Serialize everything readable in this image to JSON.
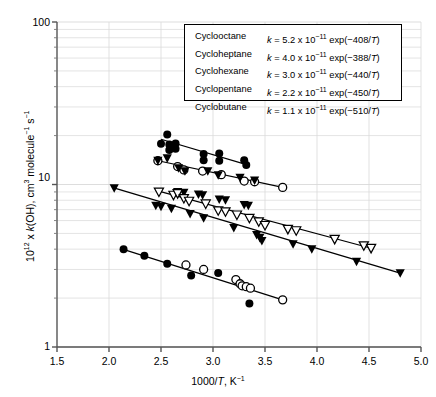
{
  "chart_data": {
    "type": "scatter",
    "title": "",
    "xlabel": "1000/T, K⁻¹",
    "ylabel": "10¹² x k(OH), cm³ molecule⁻¹ s⁻¹",
    "xscale": "linear",
    "yscale": "log",
    "xlim": [
      1.5,
      5.0
    ],
    "ylim": [
      1,
      100
    ],
    "xticks": [
      "1.5",
      "2.0",
      "2.5",
      "3.0",
      "3.5",
      "4.0",
      "4.5",
      "5.0"
    ],
    "xtick_values": [
      1.5,
      2.0,
      2.5,
      3.0,
      3.5,
      4.0,
      4.5,
      5.0
    ],
    "yticks": [
      "1",
      "10",
      "100"
    ],
    "ytick_values": [
      1,
      10,
      100
    ],
    "grid": "minor-log-horizontal-and-major-vertical",
    "legend_position": "top-right-inside-box",
    "series": [
      {
        "name": "Cyclooctane",
        "marker": "filled-circle",
        "A": "5.2 x 10⁻¹¹",
        "E_over_R": -408,
        "equation": "k = 5.2 x 10⁻¹¹ exp(−408/T)",
        "fit_line": {
          "x": [
            2.5,
            3.33
          ],
          "y": [
            19.0,
            13.2
          ]
        },
        "points": [
          {
            "x": 2.56,
            "y": 20.3
          },
          {
            "x": 2.5,
            "y": 17.8
          },
          {
            "x": 2.58,
            "y": 17.6
          },
          {
            "x": 2.64,
            "y": 17.9
          },
          {
            "x": 2.64,
            "y": 16.6
          },
          {
            "x": 2.58,
            "y": 16.3
          },
          {
            "x": 2.91,
            "y": 15.4
          },
          {
            "x": 3.06,
            "y": 15.5
          },
          {
            "x": 2.91,
            "y": 14.1
          },
          {
            "x": 3.06,
            "y": 14.0
          },
          {
            "x": 3.3,
            "y": 14.1
          },
          {
            "x": 3.32,
            "y": 13.2
          }
        ]
      },
      {
        "name": "Cycloheptane",
        "marker": "open-circle",
        "A": "4.0 x 10⁻¹¹",
        "E_over_R": -388,
        "equation": "k = 4.0 x 10⁻¹¹ exp(−388/T)",
        "fit_line": {
          "x": [
            2.45,
            3.67
          ],
          "y": [
            14.1,
            9.6
          ]
        },
        "points": [
          {
            "x": 2.47,
            "y": 14.0
          },
          {
            "x": 2.66,
            "y": 12.9
          },
          {
            "x": 2.72,
            "y": 12.3
          },
          {
            "x": 2.9,
            "y": 12.1
          },
          {
            "x": 3.08,
            "y": 11.5
          },
          {
            "x": 3.3,
            "y": 10.5
          },
          {
            "x": 3.4,
            "y": 10.4
          },
          {
            "x": 3.67,
            "y": 9.6
          }
        ]
      },
      {
        "name": "Cyclohexane",
        "marker": "filled-down-triangle",
        "A": "3.0 x 10⁻¹¹",
        "E_over_R": -440,
        "equation": "k = 3.0 x 10⁻¹¹ exp(−440/T)",
        "fit_line": {
          "x": [
            2.03,
            4.8
          ],
          "y": [
            9.6,
            2.85
          ]
        },
        "points": [
          {
            "x": 2.05,
            "y": 9.5
          },
          {
            "x": 2.45,
            "y": 7.4
          },
          {
            "x": 2.5,
            "y": 7.3
          },
          {
            "x": 2.47,
            "y": 14.0
          },
          {
            "x": 2.56,
            "y": 14.5
          },
          {
            "x": 2.67,
            "y": 12.6
          },
          {
            "x": 2.73,
            "y": 12.1
          },
          {
            "x": 2.6,
            "y": 7.1
          },
          {
            "x": 2.66,
            "y": 9.0
          },
          {
            "x": 2.72,
            "y": 8.9
          },
          {
            "x": 2.78,
            "y": 6.6
          },
          {
            "x": 2.86,
            "y": 8.7
          },
          {
            "x": 2.9,
            "y": 8.6
          },
          {
            "x": 2.91,
            "y": 6.2
          },
          {
            "x": 2.95,
            "y": 12.1
          },
          {
            "x": 3.05,
            "y": 11.4
          },
          {
            "x": 3.06,
            "y": 8.1
          },
          {
            "x": 3.12,
            "y": 8.0
          },
          {
            "x": 3.2,
            "y": 5.4
          },
          {
            "x": 3.26,
            "y": 11.0
          },
          {
            "x": 3.3,
            "y": 7.5
          },
          {
            "x": 3.34,
            "y": 7.4
          },
          {
            "x": 3.4,
            "y": 10.6
          },
          {
            "x": 3.42,
            "y": 4.9
          },
          {
            "x": 3.45,
            "y": 4.7
          },
          {
            "x": 3.47,
            "y": 4.5
          },
          {
            "x": 3.77,
            "y": 4.3
          },
          {
            "x": 3.95,
            "y": 4.0
          },
          {
            "x": 4.38,
            "y": 3.35
          },
          {
            "x": 4.8,
            "y": 2.85
          }
        ]
      },
      {
        "name": "Cyclopentane",
        "marker": "open-down-triangle",
        "A": "2.2 x 10⁻¹¹",
        "E_over_R": -450,
        "equation": "k = 2.2 x 10⁻¹¹ exp(−450/T)",
        "fit_line": {
          "x": [
            2.45,
            4.52
          ],
          "y": [
            9.2,
            4.05
          ]
        },
        "points": [
          {
            "x": 2.48,
            "y": 9.0
          },
          {
            "x": 2.62,
            "y": 8.6
          },
          {
            "x": 2.66,
            "y": 8.8
          },
          {
            "x": 2.72,
            "y": 8.2
          },
          {
            "x": 2.77,
            "y": 7.9
          },
          {
            "x": 2.93,
            "y": 7.6
          },
          {
            "x": 3.05,
            "y": 6.9
          },
          {
            "x": 3.12,
            "y": 6.8
          },
          {
            "x": 3.23,
            "y": 6.5
          },
          {
            "x": 3.35,
            "y": 6.2
          },
          {
            "x": 3.44,
            "y": 5.9
          },
          {
            "x": 3.5,
            "y": 5.6
          },
          {
            "x": 3.72,
            "y": 5.3
          },
          {
            "x": 3.8,
            "y": 5.2
          },
          {
            "x": 4.17,
            "y": 4.6
          },
          {
            "x": 4.45,
            "y": 4.2
          },
          {
            "x": 4.52,
            "y": 4.05
          }
        ]
      },
      {
        "name": "Cyclobutane",
        "marker": "filled-and-open-circle",
        "A": "1.1 x 10⁻¹¹",
        "E_over_R": -510,
        "equation": "k = 1.1 x 10⁻¹¹ exp(−510/T)",
        "fit_line": {
          "x": [
            2.13,
            3.67
          ],
          "y": [
            4.0,
            1.95
          ]
        },
        "points": [
          {
            "x": 2.14,
            "y": 4.0
          },
          {
            "x": 2.34,
            "y": 3.65
          },
          {
            "x": 2.56,
            "y": 3.25
          },
          {
            "x": 2.74,
            "y": 3.2
          },
          {
            "x": 2.79,
            "y": 2.75
          },
          {
            "x": 2.91,
            "y": 3.0
          },
          {
            "x": 3.05,
            "y": 2.85
          },
          {
            "x": 3.22,
            "y": 2.6
          },
          {
            "x": 3.26,
            "y": 2.45
          },
          {
            "x": 3.28,
            "y": 2.38
          },
          {
            "x": 3.32,
            "y": 2.35
          },
          {
            "x": 3.36,
            "y": 2.3
          },
          {
            "x": 3.35,
            "y": 1.85
          },
          {
            "x": 3.67,
            "y": 1.95
          }
        ]
      }
    ]
  },
  "axes": {
    "x_title": "1000/T, K⁻¹",
    "y_title_prefix": "10",
    "y_title_sup": "12",
    "y_title_rest": " x k(OH), cm",
    "y_title_full": "10¹² x k(OH), cm³ molecule⁻¹ s⁻¹",
    "xticks": [
      "1.5",
      "2.0",
      "2.5",
      "3.0",
      "3.5",
      "4.0",
      "4.5",
      "5.0"
    ],
    "yticks": [
      "100",
      "10",
      "1"
    ]
  },
  "legend": {
    "rows": [
      {
        "name": "Cyclooctane",
        "eq_lead": "k",
        "eq_mid": " = 5.2 x 10",
        "exp1": "−11",
        "eq_tail": " exp(−408/",
        "var": "T",
        "eq_end": ")"
      },
      {
        "name": "Cycloheptane",
        "eq_lead": "k",
        "eq_mid": " = 4.0 x 10",
        "exp1": "−11",
        "eq_tail": " exp(−388/",
        "var": "T",
        "eq_end": ")"
      },
      {
        "name": "Cyclohexane",
        "eq_lead": "k",
        "eq_mid": " = 3.0 x 10",
        "exp1": "−11",
        "eq_tail": " exp(−440/",
        "var": "T",
        "eq_end": ")"
      },
      {
        "name": "Cyclopentane",
        "eq_lead": "k",
        "eq_mid": " = 2.2 x 10",
        "exp1": "−11",
        "eq_tail": " exp(−450/",
        "var": "T",
        "eq_end": ")"
      },
      {
        "name": "Cyclobutane",
        "eq_lead": "k",
        "eq_mid": " = 1.1 x 10",
        "exp1": "−11",
        "eq_tail": " exp(−510/",
        "var": "T",
        "eq_end": ")"
      }
    ]
  },
  "colors": {
    "ink": "#000000",
    "grid": "#d9d9d9",
    "background": "#ffffff"
  }
}
